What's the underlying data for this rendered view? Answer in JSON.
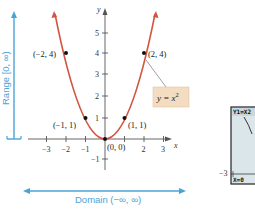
{
  "figure": {
    "function_label": "y = x",
    "function_exponent": "2",
    "range_label": "Range [0, ∞)",
    "domain_label": "Domain (−∞, ∞)",
    "x_axis_label": "x",
    "y_axis_label": "y",
    "x_ticks": [
      "−3",
      "−2",
      "−1",
      "2",
      "3"
    ],
    "y_ticks": [
      "5",
      "4",
      "3",
      "2",
      "1",
      "−1"
    ],
    "points": [
      {
        "label": "(−2, 4)",
        "x": -2,
        "y": 4
      },
      {
        "label": "(2, 4)",
        "x": 2,
        "y": 4
      },
      {
        "label": "(−1, 1)",
        "x": -1,
        "y": 1
      },
      {
        "label": "(1, 1)",
        "x": 1,
        "y": 1
      },
      {
        "label": "(0, 0)",
        "x": 0,
        "y": 0
      }
    ],
    "colors": {
      "curve": "#d2553f",
      "domain_range": "#4aa3d8",
      "label_box": "#f3dcc0",
      "calc_screen": "#dbe6ea"
    }
  },
  "calculator": {
    "top_text": "Y1=X2",
    "bottom_text": "X=0",
    "left_tick": "−3"
  }
}
